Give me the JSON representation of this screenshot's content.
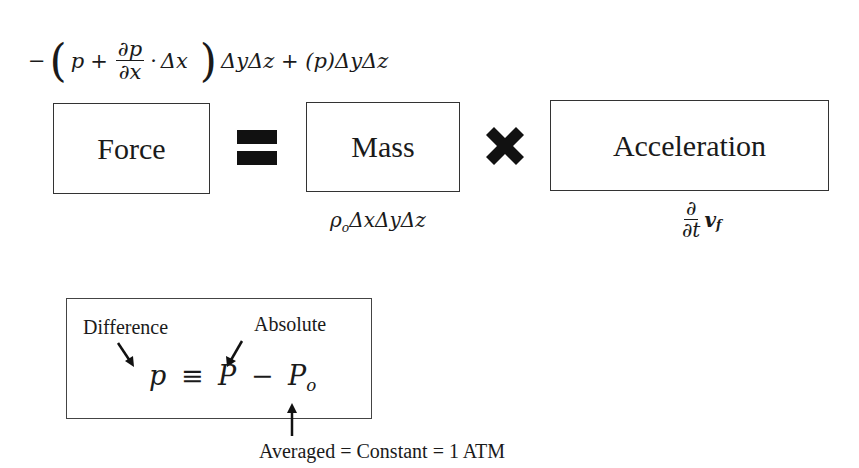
{
  "top_equation": {
    "minus": "−",
    "open_paren": "(",
    "p": "p",
    "plus": "+",
    "frac_num": "∂p",
    "frac_den": "∂x",
    "dot": "·",
    "delta_x": "Δx",
    "close_paren": ")",
    "rest": "ΔyΔz + (p)ΔyΔz"
  },
  "boxes": {
    "force": "Force",
    "mass": "Mass",
    "acceleration": "Acceleration"
  },
  "operators": {
    "equals": "equals-icon",
    "multiply": "multiply-icon"
  },
  "mass_expression": {
    "rho": "ρ",
    "rho_sub": "o",
    "rest": "ΔxΔyΔz"
  },
  "acceleration_expression": {
    "frac_num": "∂",
    "frac_den": "∂t",
    "v": "v",
    "v_sub": "f"
  },
  "pressure_definition": {
    "label_difference": "Difference",
    "label_absolute": "Absolute",
    "lhs": "p",
    "equiv": "≡",
    "P": "P",
    "minus": "−",
    "P0": "P",
    "P0_sub": "o",
    "note": "Averaged = Constant = 1 ATM"
  }
}
